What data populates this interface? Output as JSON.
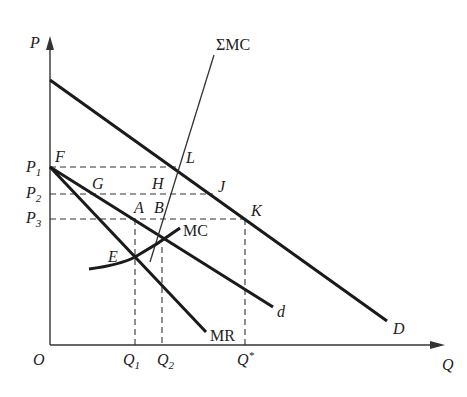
{
  "diagram": {
    "type": "economics-kinked-oligopoly-price-leadership",
    "axes": {
      "y_label": "P",
      "x_label": "Q",
      "origin_label": "O"
    },
    "price_levels": [
      {
        "main": "P",
        "sub": "1"
      },
      {
        "main": "P",
        "sub": "2"
      },
      {
        "main": "P",
        "sub": "3"
      }
    ],
    "quantity_levels": [
      {
        "main": "Q",
        "sub": "1"
      },
      {
        "main": "Q",
        "sub": "2"
      },
      {
        "main": "Q",
        "sup": "*"
      }
    ],
    "curves": {
      "market_demand": "D",
      "firm_demand": "d",
      "marginal_revenue": "MR",
      "marginal_cost": "MC",
      "sum_marginal_cost": "ΣMC"
    },
    "points": {
      "F": "F",
      "G": "G",
      "H": "H",
      "L": "L",
      "J": "J",
      "A": "A",
      "B": "B",
      "K": "K",
      "E": "E"
    }
  }
}
